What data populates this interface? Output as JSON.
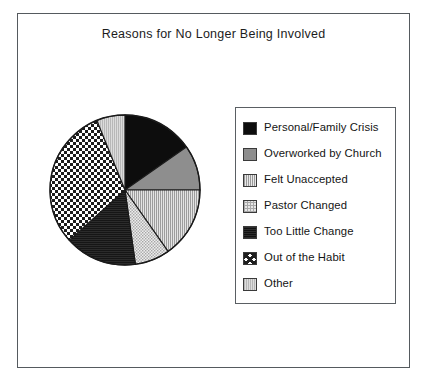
{
  "chart_data": {
    "type": "pie",
    "title": "Reasons for No Longer Being Involved",
    "xlabel": "",
    "ylabel": "",
    "legend_position": "right",
    "grid": false,
    "categories": [
      "Personal/Family  Crisis",
      "Overworked by Church",
      "Felt Unaccepted",
      "Pastor Changed",
      "Too Little Change",
      "Out of the Habit",
      "Other"
    ],
    "values": [
      15.3,
      9.7,
      15.3,
      7.5,
      15.6,
      30.6,
      6.0
    ],
    "slice_start_angles_deg": [
      0,
      55,
      90,
      145,
      172,
      228,
      338
    ],
    "slice_end_angles_deg": [
      55,
      90,
      145,
      172,
      228,
      338,
      360
    ],
    "patterns": [
      "solid-black",
      "mid-gray",
      "vertical-hatch",
      "fine-checker",
      "dark-solid",
      "bold-checker",
      "light-gray"
    ],
    "colors": [
      "#0d0d0d",
      "#8e8e8e",
      "#cfcfcf",
      "#e6e6e6",
      "#1a1a1a",
      "#ffffff",
      "#d2d2d2"
    ]
  },
  "frame": {
    "border_color": "#555a5e"
  },
  "legend": {
    "border_color": "#5a5f63",
    "items": [
      {
        "label": "Personal/Family  Crisis",
        "swatch": "sw-solid-black"
      },
      {
        "label": "Overworked by Church",
        "swatch": "sw-mid-gray"
      },
      {
        "label": "Felt Unaccepted",
        "swatch": "sw-vhatch"
      },
      {
        "label": "Pastor Changed",
        "swatch": "sw-fine-check"
      },
      {
        "label": "Too Little Change",
        "swatch": "sw-dark"
      },
      {
        "label": "Out of the Habit",
        "swatch": "sw-bold-check"
      },
      {
        "label": "Other",
        "swatch": "sw-light-gray"
      }
    ]
  }
}
